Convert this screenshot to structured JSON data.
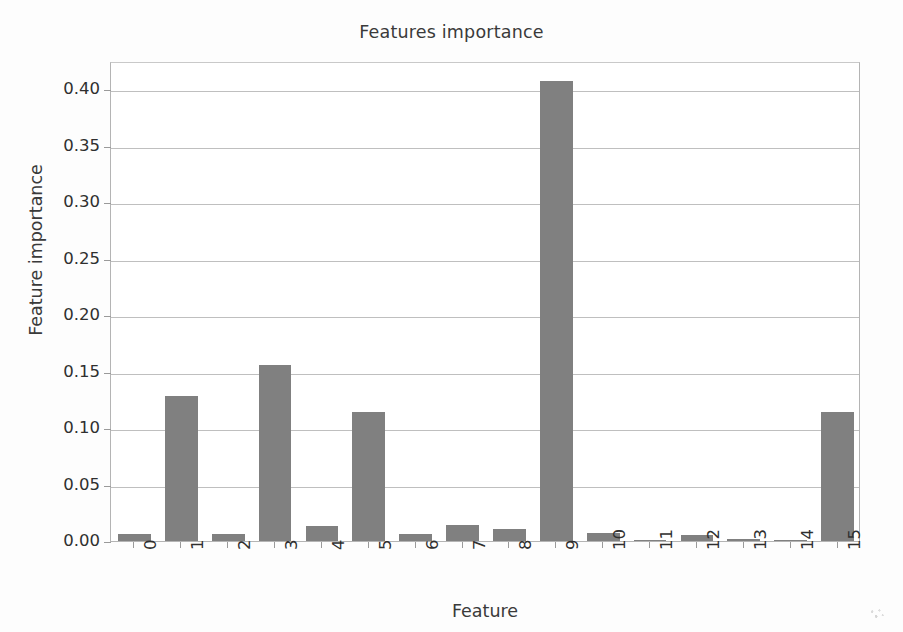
{
  "chart_data": {
    "type": "bar",
    "title": "Features importance",
    "xlabel": "Feature",
    "ylabel": "Feature importance",
    "categories": [
      "0",
      "1",
      "2",
      "3",
      "4",
      "5",
      "6",
      "7",
      "8",
      "9",
      "10",
      "11",
      "12",
      "13",
      "14",
      "15"
    ],
    "values": [
      0.006,
      0.128,
      0.006,
      0.156,
      0.013,
      0.114,
      0.006,
      0.014,
      0.011,
      0.407,
      0.007,
      0.001,
      0.005,
      0.002,
      0.0005,
      0.114
    ],
    "ylim": [
      0.0,
      0.425
    ],
    "xlim": [
      -0.5,
      15.5
    ],
    "ytick_labels": [
      "0.00",
      "0.05",
      "0.10",
      "0.15",
      "0.20",
      "0.25",
      "0.30",
      "0.35",
      "0.40"
    ],
    "ytick_values": [
      0.0,
      0.05,
      0.1,
      0.15,
      0.2,
      0.25,
      0.3,
      0.35,
      0.4
    ],
    "grid": "horizontal",
    "legend": "none",
    "bar_color": "#808080",
    "grid_color": "#bfbfbf",
    "axis_color": "#b4b4b4",
    "xtick_rotation": 90
  }
}
